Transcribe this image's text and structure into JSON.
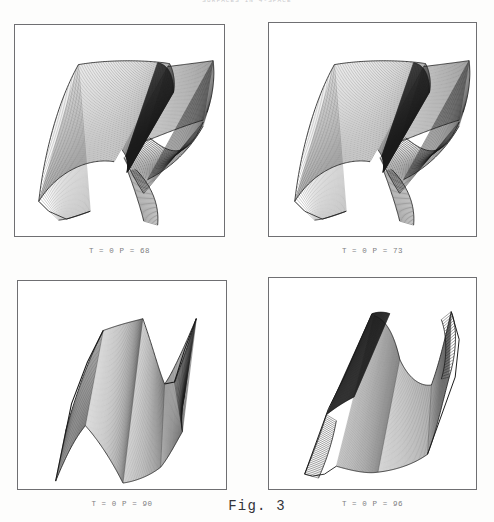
{
  "document": {
    "running_head": "SURFACES IN 4-SPACE",
    "figure_label": "Fig. 3"
  },
  "panels": [
    {
      "id": "panel-top-left",
      "caption": "T = 0   P = 68",
      "params": {
        "T": "0",
        "P": "68"
      },
      "surface": "ruled-surface-folded-saddle"
    },
    {
      "id": "panel-top-right",
      "caption": "T = 0   P = 73",
      "params": {
        "T": "0",
        "P": "73"
      },
      "surface": "ruled-surface-folded-saddle"
    },
    {
      "id": "panel-bottom-left",
      "caption": "T = 0   P = 90",
      "params": {
        "T": "0",
        "P": "90"
      },
      "surface": "ruled-surface-twisted-band"
    },
    {
      "id": "panel-bottom-right",
      "caption": "T = 0   P = 96",
      "params": {
        "T": "0",
        "P": "96"
      },
      "surface": "ruled-surface-twisted-cusp"
    }
  ],
  "colors": {
    "ink": "#1a1a1a",
    "panel_border": "#6f6f72",
    "caption_text": "#7d7d82",
    "paper": "#fdfdfc"
  }
}
